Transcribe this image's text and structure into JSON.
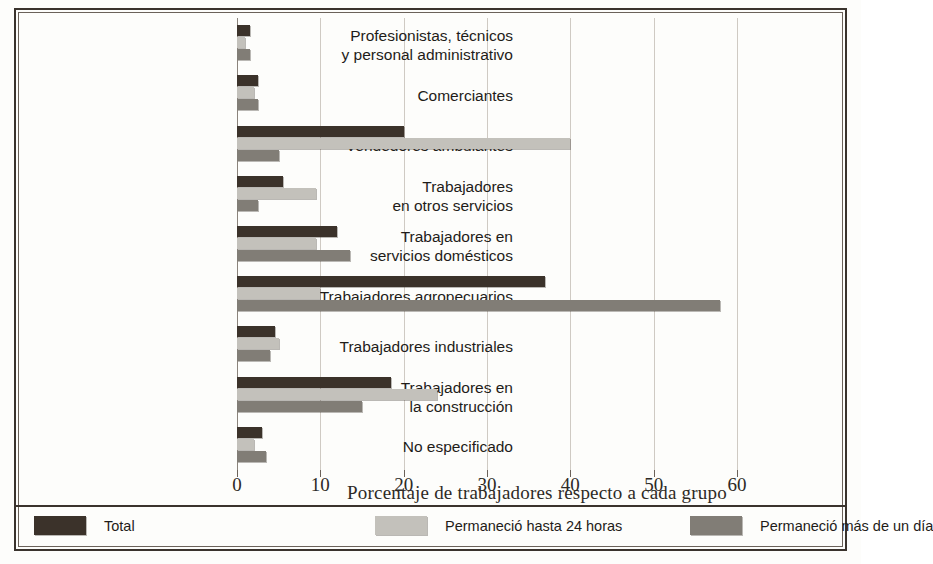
{
  "chart_data": {
    "type": "bar",
    "orientation": "horizontal",
    "title": "",
    "xlabel": "Porcentaje de trabajadores respecto a cada grupo",
    "ylabel": "",
    "xlim": [
      0,
      63
    ],
    "xticks": [
      0,
      10,
      20,
      30,
      40,
      50,
      60
    ],
    "xtick_labels": [
      "0",
      "10",
      "20",
      "30",
      "40",
      "50",
      "60"
    ],
    "grid": true,
    "legend_position": "bottom",
    "categories": [
      "Profesionistas, técnicos\ny personal administrativo",
      "Comerciantes",
      "Vendedores ambulantes",
      "Trabajadores\nen otros servicios",
      "Trabajadores en\nservicios domésticos",
      "Trabajadores agropecuarios",
      "Trabajadores industriales",
      "Trabajadores en\nla construcción",
      "No especificado"
    ],
    "series": [
      {
        "name": "Total",
        "color": "#3b322a",
        "values": [
          1.5,
          2.5,
          20.0,
          5.5,
          12.0,
          37.0,
          4.5,
          18.5,
          3.0
        ]
      },
      {
        "name": "Permaneció hasta 24 horas",
        "color": "#c3c1bb",
        "values": [
          1.0,
          2.0,
          40.0,
          9.5,
          9.5,
          10.0,
          5.0,
          24.0,
          2.0
        ]
      },
      {
        "name": "Permaneció más de un día",
        "color": "#817d76",
        "values": [
          1.5,
          2.5,
          5.0,
          2.5,
          13.5,
          58.0,
          4.0,
          15.0,
          3.5
        ]
      }
    ]
  },
  "colors": {
    "total": "#3b322a",
    "hasta_24_horas": "#c3c1bb",
    "mas_de_un_dia": "#817d76",
    "frame": "#3a332d",
    "grid": "#cfcac3",
    "background": "#fdfdfb"
  },
  "legend": {
    "items": [
      {
        "label": "Total",
        "color": "#3b322a"
      },
      {
        "label": "Permaneció hasta 24 horas",
        "color": "#c3c1bb"
      },
      {
        "label": "Permaneció más de un día",
        "color": "#817d76"
      }
    ]
  }
}
